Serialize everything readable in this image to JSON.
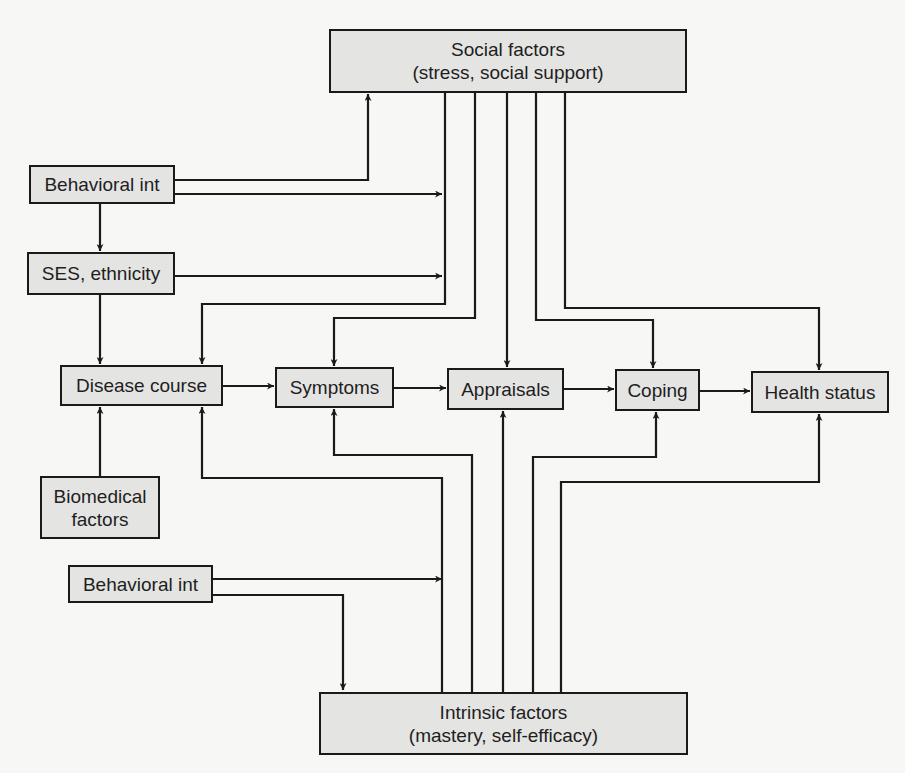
{
  "diagram": {
    "nodes": {
      "social": {
        "line1": "Social factors",
        "line2": "(stress, social support)"
      },
      "behavioral_top": {
        "label": "Behavioral int"
      },
      "ses": {
        "label": "SES, ethnicity"
      },
      "disease": {
        "label": "Disease course"
      },
      "symptoms": {
        "label": "Symptoms"
      },
      "appraisals": {
        "label": "Appraisals"
      },
      "coping": {
        "label": "Coping"
      },
      "health": {
        "label": "Health status"
      },
      "biomedical": {
        "line1": "Biomedical",
        "line2": "factors"
      },
      "behavioral_bottom": {
        "label": "Behavioral int"
      },
      "intrinsic": {
        "line1": "Intrinsic factors",
        "line2": "(mastery, self-efficacy)"
      }
    },
    "edges": [
      {
        "from": "Behavioral int (top)",
        "to": "Social factors"
      },
      {
        "from": "Behavioral int (top)",
        "to": "Social/Intrinsic pathways"
      },
      {
        "from": "Behavioral int (top)",
        "to": "SES, ethnicity"
      },
      {
        "from": "SES, ethnicity",
        "to": "Social/Intrinsic pathways"
      },
      {
        "from": "SES, ethnicity",
        "to": "Disease course"
      },
      {
        "from": "Biomedical factors",
        "to": "Disease course"
      },
      {
        "from": "Disease course",
        "to": "Symptoms"
      },
      {
        "from": "Symptoms",
        "to": "Appraisals"
      },
      {
        "from": "Appraisals",
        "to": "Coping"
      },
      {
        "from": "Coping",
        "to": "Health status"
      },
      {
        "from": "Social factors",
        "to": "Disease course"
      },
      {
        "from": "Social factors",
        "to": "Symptoms"
      },
      {
        "from": "Social factors",
        "to": "Appraisals"
      },
      {
        "from": "Social factors",
        "to": "Coping"
      },
      {
        "from": "Social factors",
        "to": "Health status"
      },
      {
        "from": "Intrinsic factors",
        "to": "Disease course"
      },
      {
        "from": "Intrinsic factors",
        "to": "Symptoms"
      },
      {
        "from": "Intrinsic factors",
        "to": "Appraisals"
      },
      {
        "from": "Intrinsic factors",
        "to": "Coping"
      },
      {
        "from": "Intrinsic factors",
        "to": "Health status"
      },
      {
        "from": "Behavioral int (bottom)",
        "to": "Social/Intrinsic pathways"
      },
      {
        "from": "Behavioral int (bottom)",
        "to": "Intrinsic factors"
      }
    ],
    "colors": {
      "box_fill": "#e4e4e3",
      "stroke": "#1a1a1a",
      "background": "#f7f7f6"
    }
  }
}
